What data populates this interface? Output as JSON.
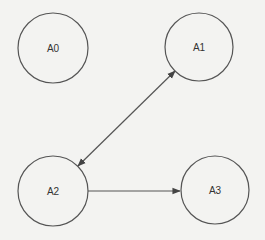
{
  "diagram": {
    "type": "directed-graph",
    "background": "#f3f3f1",
    "stroke_color": "#555555",
    "nodes": [
      {
        "id": "A0",
        "label": "A0",
        "cx": 53,
        "cy": 48,
        "r": 35
      },
      {
        "id": "A1",
        "label": "A1",
        "cx": 199,
        "cy": 47,
        "r": 34
      },
      {
        "id": "A2",
        "label": "A2",
        "cx": 53,
        "cy": 191,
        "r": 35
      },
      {
        "id": "A3",
        "label": "A3",
        "cx": 215,
        "cy": 190,
        "r": 34
      }
    ],
    "edges": [
      {
        "from": "A2",
        "to": "A1",
        "bidirectional": true
      },
      {
        "from": "A2",
        "to": "A3",
        "bidirectional": false
      }
    ]
  }
}
